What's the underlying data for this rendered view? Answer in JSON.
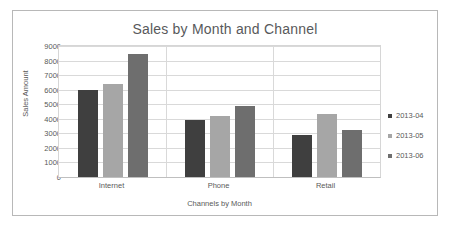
{
  "chart_data": {
    "type": "bar",
    "title": "Sales by Month and Channel",
    "xlabel": "Channels by Month",
    "ylabel": "Sales Amount",
    "categories": [
      "Internet",
      "Phone",
      "Retail"
    ],
    "series": [
      {
        "name": "2013-04",
        "color": "#3f3f3f",
        "values": [
          5950,
          3950,
          2880
        ]
      },
      {
        "name": "2013-05",
        "color": "#a6a6a6",
        "values": [
          6420,
          4160,
          4350
        ]
      },
      {
        "name": "2013-06",
        "color": "#6e6e6e",
        "values": [
          8480,
          4860,
          3250
        ]
      }
    ],
    "ylim": [
      0,
      9000
    ],
    "yticks": [
      9000,
      8000,
      7000,
      6000,
      5000,
      4000,
      3000,
      2000,
      1000,
      0
    ],
    "grid": true,
    "legend_position": "right"
  }
}
